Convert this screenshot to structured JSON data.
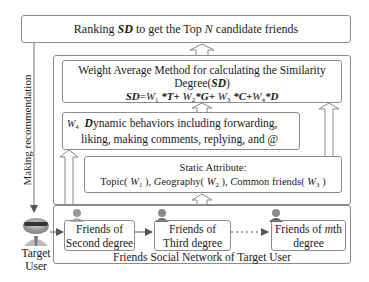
{
  "diagram": {
    "top_box": {
      "prefix": "Ranking ",
      "sd": "SD",
      "middle": " to get the Top ",
      "n": "N",
      "suffix": " candidate friends"
    },
    "weight_box": {
      "line1": "Weight Average Method for calculating the Similarity",
      "line2_prefix": "Degree(",
      "line2_sd": "SD",
      "line2_suffix": ")",
      "formula": {
        "sd": "SD",
        "eq": "=",
        "w1": "W",
        "w1_sub": "1",
        "t": " *T+ ",
        "w2": "W",
        "w2_sub": "2",
        "g": "*G+ ",
        "w3": "W",
        "w3_sub": "3",
        "c": " *C+",
        "w4": "W",
        "w4_sub": "4",
        "d": "*D"
      }
    },
    "dynamic_box": {
      "weight": "W",
      "weight_sub": "4",
      "d": "D",
      "line1_rest": "ynamic behaviors including forwarding,",
      "line2": "liking, making comments, replying, and @"
    },
    "static_box": {
      "title": "Static Attribute:",
      "topic": "Topic( ",
      "w1": "W",
      "w1_sub": "1",
      "sep1": " ),  ",
      "g": "G",
      "geo": "eography( ",
      "w2": "W",
      "w2_sub": "2",
      "sep2": " ), ",
      "c": "C",
      "common": "ommon friends( ",
      "w3": "W",
      "w3_sub": "3",
      "end": " )"
    },
    "network": {
      "label": "Friends Social Network of Target User",
      "nodes": [
        {
          "line1": "Friends of",
          "line2": "Second degree"
        },
        {
          "line1": "Friends of",
          "line2": "Third degree"
        },
        {
          "line1_prefix": "Friends of ",
          "line1_m": "m",
          "line1_suffix": "th",
          "line2": "degree"
        }
      ],
      "ellipsis": "···"
    },
    "target_user": {
      "line1": "Target",
      "line2": "User"
    },
    "side_label": "Making recommendation"
  },
  "colors": {
    "border": "#8c8c8c",
    "arrow": "#555555",
    "text": "#1a1a1a"
  }
}
